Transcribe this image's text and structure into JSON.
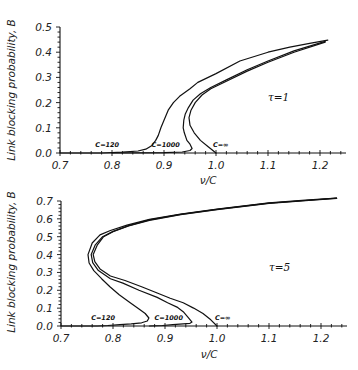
{
  "figure": {
    "panels": [
      "tau-1",
      "tau-5"
    ]
  },
  "chart_data": [
    {
      "type": "line",
      "title": "",
      "annotation": "τ=1",
      "annotation_pos": [
        1.1,
        0.205
      ],
      "xlabel": "ν/C",
      "ylabel": "Link blocking probability, B",
      "xlim": [
        0.7,
        1.25
      ],
      "ylim": [
        0.0,
        0.5
      ],
      "grid": false,
      "legend": "inline labels near x-axis",
      "xticks": [
        0.7,
        0.8,
        0.9,
        1.0,
        1.1,
        1.2
      ],
      "xtick_labels": [
        "0.7",
        "0.8",
        "0.9",
        "1.0",
        "1.1",
        "1.2"
      ],
      "yticks": [
        0.0,
        0.1,
        0.2,
        0.3,
        0.4,
        0.5
      ],
      "ytick_labels": [
        "0.0",
        "0.1",
        "0.2",
        "0.3",
        "0.4",
        "0.5"
      ],
      "series": [
        {
          "name": "C=120",
          "label_pos": [
            0.768,
            0.022
          ],
          "points": [
            [
              0.7,
              0.0
            ],
            [
              0.78,
              0.0
            ],
            [
              0.82,
              0.003
            ],
            [
              0.85,
              0.008
            ],
            [
              0.865,
              0.015
            ],
            [
              0.877,
              0.03
            ],
            [
              0.884,
              0.05
            ],
            [
              0.889,
              0.07
            ],
            [
              0.894,
              0.1
            ],
            [
              0.9,
              0.13
            ],
            [
              0.908,
              0.17
            ],
            [
              0.918,
              0.2
            ],
            [
              0.93,
              0.225
            ],
            [
              0.95,
              0.255
            ],
            [
              0.965,
              0.28
            ],
            [
              1.0,
              0.315
            ],
            [
              1.046,
              0.365
            ],
            [
              1.1,
              0.4
            ],
            [
              1.142,
              0.42
            ],
            [
              1.18,
              0.435
            ],
            [
              1.215,
              0.448
            ]
          ]
        },
        {
          "name": "C=1000",
          "label_pos": [
            0.876,
            0.022
          ],
          "points": [
            [
              0.8,
              0.0
            ],
            [
              0.9,
              0.001
            ],
            [
              0.935,
              0.004
            ],
            [
              0.95,
              0.01
            ],
            [
              0.954,
              0.018
            ],
            [
              0.95,
              0.035
            ],
            [
              0.944,
              0.05
            ],
            [
              0.939,
              0.08
            ],
            [
              0.937,
              0.1
            ],
            [
              0.938,
              0.13
            ],
            [
              0.941,
              0.155
            ],
            [
              0.947,
              0.18
            ],
            [
              0.956,
              0.21
            ],
            [
              0.97,
              0.235
            ],
            [
              0.99,
              0.26
            ],
            [
              1.02,
              0.29
            ],
            [
              1.06,
              0.33
            ],
            [
              1.1,
              0.365
            ],
            [
              1.15,
              0.405
            ],
            [
              1.21,
              0.443
            ]
          ]
        },
        {
          "name": "C=∞",
          "label_pos": [
            0.994,
            0.022
          ],
          "points": [
            [
              1.0,
              0.0
            ],
            [
              0.985,
              0.025
            ],
            [
              0.97,
              0.05
            ],
            [
              0.958,
              0.08
            ],
            [
              0.95,
              0.11
            ],
            [
              0.948,
              0.14
            ],
            [
              0.952,
              0.17
            ],
            [
              0.96,
              0.2
            ],
            [
              0.973,
              0.23
            ],
            [
              0.99,
              0.255
            ],
            [
              1.02,
              0.285
            ],
            [
              1.06,
              0.325
            ],
            [
              1.1,
              0.36
            ],
            [
              1.15,
              0.4
            ],
            [
              1.21,
              0.44
            ]
          ]
        }
      ]
    },
    {
      "type": "line",
      "title": "",
      "annotation": "τ=5",
      "annotation_pos": [
        1.1,
        0.31
      ],
      "xlabel": "ν/C",
      "ylabel": "Link blocking probability, B",
      "xlim": [
        0.7,
        1.25
      ],
      "ylim": [
        0.0,
        0.7
      ],
      "grid": false,
      "legend": "inline labels near x-axis",
      "xticks": [
        0.7,
        0.8,
        0.9,
        1.0,
        1.1,
        1.2
      ],
      "xtick_labels": [
        "0.7",
        "0.8",
        "0.9",
        "1.0",
        "1.1",
        "1.2"
      ],
      "yticks": [
        0.0,
        0.1,
        0.2,
        0.3,
        0.4,
        0.5,
        0.6,
        0.7
      ],
      "ytick_labels": [
        "0.0",
        "0.1",
        "0.2",
        "0.3",
        "0.4",
        "0.5",
        "0.6",
        "0.7"
      ],
      "series": [
        {
          "name": "C=120",
          "label_pos": [
            0.758,
            0.032
          ],
          "points": [
            [
              1.23,
              0.717
            ],
            [
              1.17,
              0.705
            ],
            [
              1.1,
              0.69
            ],
            [
              1.0,
              0.655
            ],
            [
              0.93,
              0.627
            ],
            [
              0.87,
              0.597
            ],
            [
              0.827,
              0.565
            ],
            [
              0.795,
              0.535
            ],
            [
              0.775,
              0.51
            ],
            [
              0.76,
              0.465
            ],
            [
              0.752,
              0.4
            ],
            [
              0.754,
              0.353
            ],
            [
              0.763,
              0.31
            ],
            [
              0.778,
              0.265
            ],
            [
              0.794,
              0.22
            ],
            [
              0.812,
              0.175
            ],
            [
              0.833,
              0.13
            ],
            [
              0.85,
              0.095
            ],
            [
              0.862,
              0.07
            ],
            [
              0.869,
              0.045
            ],
            [
              0.866,
              0.028
            ],
            [
              0.855,
              0.018
            ],
            [
              0.835,
              0.012
            ],
            [
              0.813,
              0.008
            ],
            [
              0.79,
              0.003
            ],
            [
              0.77,
              0.0
            ],
            [
              0.7,
              0.0
            ]
          ]
        },
        {
          "name": "C=1000",
          "label_pos": [
            0.88,
            0.032
          ],
          "points": [
            [
              1.23,
              0.716
            ],
            [
              1.17,
              0.703
            ],
            [
              1.1,
              0.688
            ],
            [
              1.0,
              0.653
            ],
            [
              0.93,
              0.625
            ],
            [
              0.87,
              0.594
            ],
            [
              0.83,
              0.562
            ],
            [
              0.8,
              0.53
            ],
            [
              0.78,
              0.5
            ],
            [
              0.766,
              0.455
            ],
            [
              0.758,
              0.4
            ],
            [
              0.761,
              0.355
            ],
            [
              0.772,
              0.31
            ],
            [
              0.795,
              0.265
            ],
            [
              0.819,
              0.24
            ],
            [
              0.85,
              0.2
            ],
            [
              0.885,
              0.16
            ],
            [
              0.905,
              0.13
            ],
            [
              0.923,
              0.106
            ],
            [
              0.935,
              0.08
            ],
            [
              0.944,
              0.05
            ],
            [
              0.952,
              0.022
            ],
            [
              0.948,
              0.015
            ],
            [
              0.935,
              0.012
            ],
            [
              0.915,
              0.008
            ],
            [
              0.895,
              0.003
            ],
            [
              0.87,
              0.0
            ]
          ]
        },
        {
          "name": "C=∞",
          "label_pos": [
            0.996,
            0.032
          ],
          "points": [
            [
              1.23,
              0.715
            ],
            [
              1.17,
              0.702
            ],
            [
              1.1,
              0.687
            ],
            [
              1.0,
              0.652
            ],
            [
              0.93,
              0.624
            ],
            [
              0.87,
              0.592
            ],
            [
              0.83,
              0.56
            ],
            [
              0.8,
              0.528
            ],
            [
              0.782,
              0.5
            ],
            [
              0.77,
              0.455
            ],
            [
              0.762,
              0.4
            ],
            [
              0.765,
              0.36
            ],
            [
              0.775,
              0.32
            ],
            [
              0.795,
              0.28
            ],
            [
              0.823,
              0.255
            ],
            [
              0.855,
              0.22
            ],
            [
              0.885,
              0.185
            ],
            [
              0.91,
              0.155
            ],
            [
              0.935,
              0.13
            ],
            [
              0.955,
              0.1
            ],
            [
              0.973,
              0.07
            ],
            [
              0.988,
              0.035
            ],
            [
              1.0,
              0.0
            ]
          ]
        }
      ]
    }
  ]
}
